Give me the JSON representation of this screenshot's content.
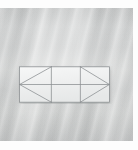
{
  "image": {
    "title": "Cross-braced frame elevation diagram",
    "subject": "three-bay rectangular frame with chevron bracing",
    "background_color": "#c9cbcb",
    "plate_color": "#f2f3f3",
    "line_color": "#8b8f92",
    "margin_color": "#fdfdfd"
  },
  "diagram": {
    "name": "cross-braced-frame",
    "outline": {
      "label": "frame outline",
      "x": 0,
      "y": 0,
      "width": 99,
      "height": 39
    },
    "bays": [
      {
        "label": "left bay",
        "x": 0,
        "width": 35,
        "bracing": "chevron-left"
      },
      {
        "label": "center bay",
        "x": 35,
        "width": 32,
        "bracing": "none"
      },
      {
        "label": "right bay",
        "x": 67,
        "width": 32,
        "bracing": "chevron-right"
      }
    ],
    "members": [
      {
        "name": "top-chord",
        "type": "horizontal",
        "x1": 0,
        "y1": 0,
        "x2": 99,
        "y2": 0
      },
      {
        "name": "bottom-chord",
        "type": "horizontal",
        "x1": 0,
        "y1": 39,
        "x2": 99,
        "y2": 39
      },
      {
        "name": "mid-chord",
        "type": "horizontal",
        "x1": 0,
        "y1": 19.5,
        "x2": 99,
        "y2": 19.5
      },
      {
        "name": "left-post",
        "type": "vertical",
        "x1": 0,
        "y1": 0,
        "x2": 0,
        "y2": 39
      },
      {
        "name": "interior-post-1",
        "type": "vertical",
        "x1": 35,
        "y1": 0,
        "x2": 35,
        "y2": 39
      },
      {
        "name": "interior-post-2",
        "type": "vertical",
        "x1": 67,
        "y1": 0,
        "x2": 67,
        "y2": 39
      },
      {
        "name": "right-post",
        "type": "vertical",
        "x1": 99,
        "y1": 0,
        "x2": 99,
        "y2": 39
      },
      {
        "name": "left-brace-upper",
        "type": "diagonal",
        "x1": 35,
        "y1": 0,
        "x2": 0,
        "y2": 19.5
      },
      {
        "name": "left-brace-lower",
        "type": "diagonal",
        "x1": 35,
        "y1": 39,
        "x2": 0,
        "y2": 19.5
      },
      {
        "name": "right-brace-upper",
        "type": "diagonal",
        "x1": 67,
        "y1": 0,
        "x2": 99,
        "y2": 19.5
      },
      {
        "name": "right-brace-lower",
        "type": "diagonal",
        "x1": 67,
        "y1": 39,
        "x2": 99,
        "y2": 19.5
      }
    ],
    "nodes": [
      {
        "name": "left-apex",
        "x": 0,
        "y": 19.5
      },
      {
        "name": "right-apex",
        "x": 99,
        "y": 19.5
      }
    ]
  },
  "chart_data": {
    "type": "diagram",
    "xlabel": "",
    "ylabel": "",
    "categories": [
      "left bay",
      "center bay",
      "right bay"
    ],
    "values": [
      35,
      32,
      32
    ],
    "series": [
      {
        "name": "bay width (px)",
        "values": [
          35,
          32,
          32
        ]
      },
      {
        "name": "bay height (px)",
        "values": [
          39,
          39,
          39
        ]
      }
    ],
    "annotations": [
      "left bay braced with leftward-pointing chevron",
      "center bay unbraced, mid-chord only",
      "right bay braced with rightward-pointing chevron"
    ]
  }
}
